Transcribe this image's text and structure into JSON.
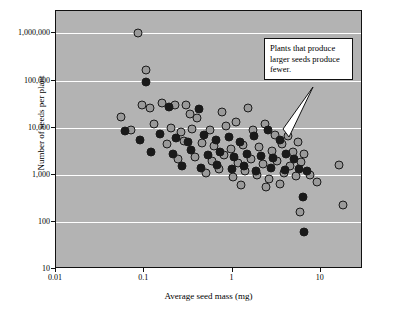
{
  "chart_data": {
    "type": "scatter",
    "title": "",
    "xlabel": "Average seed mass (mg)",
    "ylabel": "Number of seeds per plant",
    "xscale": "log",
    "yscale": "log",
    "xlim": [
      0.01,
      30
    ],
    "ylim": [
      10,
      3000000
    ],
    "grid": true,
    "legend": null,
    "xticks": [
      "0.01",
      "0.1",
      "1",
      "10"
    ],
    "xtick_values": [
      0.01,
      0.1,
      1,
      10
    ],
    "yticks": [
      "1,000,000",
      "100,000",
      "10,000",
      "1,000",
      "100",
      "10"
    ],
    "ytick_values": [
      1000000,
      100000,
      10000,
      1000,
      100,
      10
    ],
    "annotations": [
      {
        "text": "Plants that produce larger seeds produce fewer.",
        "x": 6.0,
        "y": 2600
      }
    ],
    "series": [
      {
        "name": "light-filled points",
        "marker": "light",
        "points": [
          [
            0.085,
            1000000
          ],
          [
            0.105,
            170000
          ],
          [
            0.095,
            30000
          ],
          [
            0.115,
            26000
          ],
          [
            0.16,
            34000
          ],
          [
            0.22,
            31000
          ],
          [
            0.3,
            30000
          ],
          [
            0.33,
            20000
          ],
          [
            0.4,
            16000
          ],
          [
            0.75,
            22000
          ],
          [
            1.5,
            26000
          ],
          [
            0.055,
            17000
          ],
          [
            0.07,
            9000
          ],
          [
            0.13,
            12000
          ],
          [
            0.2,
            10000
          ],
          [
            0.26,
            8000
          ],
          [
            0.35,
            9500
          ],
          [
            0.55,
            9000
          ],
          [
            0.85,
            11000
          ],
          [
            1.1,
            13000
          ],
          [
            1.7,
            9000
          ],
          [
            2.3,
            12000
          ],
          [
            3.0,
            7000
          ],
          [
            4.2,
            6500
          ],
          [
            5.5,
            5000
          ],
          [
            0.18,
            4500
          ],
          [
            0.28,
            5200
          ],
          [
            0.45,
            4800
          ],
          [
            0.62,
            4000
          ],
          [
            0.95,
            3600
          ],
          [
            1.3,
            4200
          ],
          [
            2.0,
            3800
          ],
          [
            2.8,
            3200
          ],
          [
            3.6,
            4500
          ],
          [
            4.8,
            3000
          ],
          [
            6.5,
            2800
          ],
          [
            0.24,
            2200
          ],
          [
            0.38,
            2400
          ],
          [
            0.58,
            2000
          ],
          [
            0.8,
            2600
          ],
          [
            1.15,
            1800
          ],
          [
            1.6,
            2200
          ],
          [
            2.2,
            1700
          ],
          [
            3.2,
            2000
          ],
          [
            4.5,
            1500
          ],
          [
            6.0,
            1900
          ],
          [
            0.5,
            1100
          ],
          [
            0.7,
            1300
          ],
          [
            1.0,
            900
          ],
          [
            1.4,
            1200
          ],
          [
            1.9,
            1000
          ],
          [
            2.6,
            800
          ],
          [
            3.8,
            1100
          ],
          [
            5.2,
            950
          ],
          [
            7.5,
            1000
          ],
          [
            9.0,
            700
          ],
          [
            1.25,
            600
          ],
          [
            2.4,
            550
          ],
          [
            3.4,
            650
          ],
          [
            16.0,
            1600
          ],
          [
            18.0,
            230
          ],
          [
            5.8,
            160
          ]
        ]
      },
      {
        "name": "dark-filled points",
        "marker": "dark",
        "points": [
          [
            0.105,
            95000
          ],
          [
            0.19,
            28000
          ],
          [
            0.42,
            25000
          ],
          [
            0.06,
            8500
          ],
          [
            0.09,
            5500
          ],
          [
            0.15,
            7500
          ],
          [
            0.23,
            6000
          ],
          [
            0.31,
            5000
          ],
          [
            0.48,
            7000
          ],
          [
            0.65,
            5500
          ],
          [
            0.9,
            6200
          ],
          [
            1.2,
            5000
          ],
          [
            1.75,
            6500
          ],
          [
            2.5,
            9000
          ],
          [
            3.4,
            5500
          ],
          [
            0.12,
            3000
          ],
          [
            0.21,
            2800
          ],
          [
            0.34,
            3400
          ],
          [
            0.52,
            2600
          ],
          [
            0.72,
            3000
          ],
          [
            1.05,
            2400
          ],
          [
            1.45,
            2800
          ],
          [
            2.1,
            2500
          ],
          [
            2.9,
            2300
          ],
          [
            4.0,
            2700
          ],
          [
            5.0,
            2200
          ],
          [
            0.27,
            1500
          ],
          [
            0.44,
            1400
          ],
          [
            0.66,
            1600
          ],
          [
            0.98,
            1300
          ],
          [
            1.35,
            1500
          ],
          [
            1.85,
            1200
          ],
          [
            2.7,
            1400
          ],
          [
            3.9,
            1250
          ],
          [
            5.6,
            1300
          ],
          [
            7.0,
            1200
          ],
          [
            6.2,
            330
          ],
          [
            6.5,
            60
          ]
        ]
      }
    ]
  },
  "annotation": {
    "text": "Plants that produce larger seeds produce fewer."
  },
  "axes": {
    "xlabel": "Average seed mass (mg)",
    "ylabel": "Number of seeds per plant"
  }
}
